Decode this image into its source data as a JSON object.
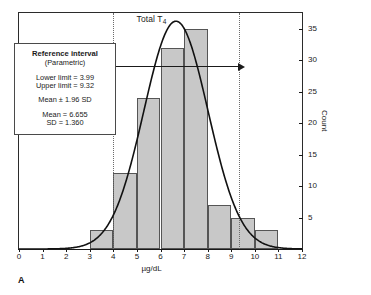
{
  "panel": {
    "label": "A"
  },
  "chart_data": {
    "type": "bar",
    "title": "Total T4",
    "title_base": "Total T",
    "title_sub": "4",
    "xlabel": "µg/dL",
    "ylabel": "Count",
    "xlim": [
      0,
      12
    ],
    "ylim": [
      0,
      37.5
    ],
    "grid": false,
    "bin_width": 1,
    "categories": [
      "3-4",
      "4-5",
      "5-6",
      "6-7",
      "7-8",
      "8-9",
      "9-10",
      "10-11"
    ],
    "bin_edges": [
      3,
      4,
      5,
      6,
      7,
      8,
      9,
      10,
      11
    ],
    "values": [
      3,
      12,
      24,
      32,
      35,
      7,
      5,
      3
    ],
    "xticks": [
      0,
      1,
      2,
      3,
      4,
      5,
      6,
      7,
      8,
      9,
      10,
      11,
      12
    ],
    "yticks": [
      5,
      10,
      15,
      20,
      25,
      30,
      35
    ],
    "bar_fill": "#c8c8c8",
    "bar_stroke": "#555555",
    "curve": {
      "name": "Gaussian fit",
      "mean": 6.655,
      "sd": 1.36,
      "peak_count": 36.2,
      "color": "#111111"
    },
    "reference_lines": [
      {
        "name": "lower-limit",
        "x": 3.99,
        "style": "dotted"
      },
      {
        "name": "upper-limit",
        "x": 9.32,
        "style": "dotted"
      }
    ],
    "annotation_arrow": {
      "from": 3.99,
      "to": 9.32,
      "at_count": 29,
      "double_headed": true
    }
  },
  "info_box": {
    "title": "Reference interval",
    "subtitle": "(Parametric)",
    "lower_limit": "Lower limit = 3.99",
    "upper_limit": "Upper limit = 9.32",
    "mean_sd_rule": "Mean ± 1.96 SD",
    "mean": "Mean = 6.655",
    "sd": "SD = 1.360"
  }
}
